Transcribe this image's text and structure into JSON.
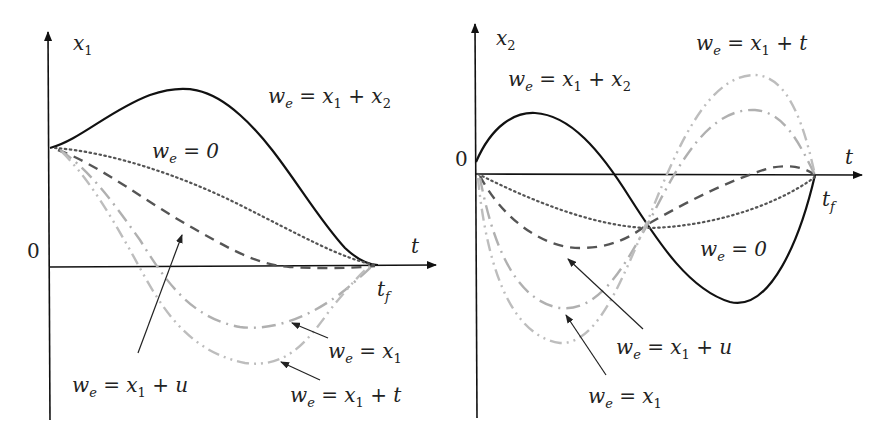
{
  "figure": {
    "left_panel": {
      "y_axis_label": "x",
      "y_axis_sub": "1",
      "x_axis_label": "t",
      "origin_label": "0",
      "end_label": "t",
      "end_sub": "f",
      "annotations": {
        "we_x1_x2": {
          "w": "w",
          "e": "e",
          "rest": " = x",
          "s1": "1",
          "plus": " + x",
          "s2": "2"
        },
        "we_0": {
          "w": "w",
          "e": "e",
          "rest": " = 0"
        },
        "we_x1_u": {
          "w": "w",
          "e": "e",
          "rest": " = x",
          "s1": "1",
          "tail": " + u"
        },
        "we_x1": {
          "w": "w",
          "e": "e",
          "rest": " = x",
          "s1": "1"
        },
        "we_x1_t": {
          "w": "w",
          "e": "e",
          "rest": " = x",
          "s1": "1",
          "tail": " + t"
        }
      }
    },
    "right_panel": {
      "y_axis_label": "x",
      "y_axis_sub": "2",
      "x_axis_label": "t",
      "origin_label": "0",
      "end_label": "t",
      "end_sub": "f",
      "annotations": {
        "we_x1_x2": {
          "w": "w",
          "e": "e",
          "rest": " = x",
          "s1": "1",
          "plus": " + x",
          "s2": "2"
        },
        "we_x1_t": {
          "w": "w",
          "e": "e",
          "rest": " = x",
          "s1": "1",
          "tail": " + t"
        },
        "we_0": {
          "w": "w",
          "e": "e",
          "rest": " = 0"
        },
        "we_x1_u": {
          "w": "w",
          "e": "e",
          "rest": " = x",
          "s1": "1",
          "tail": " + u"
        },
        "we_x1": {
          "w": "w",
          "e": "e",
          "rest": " = x",
          "s1": "1"
        }
      }
    },
    "legend_styles": [
      {
        "label": "w_e = x1 + x2",
        "style": "solid",
        "color": "#111111"
      },
      {
        "label": "w_e = 0",
        "style": "dotted",
        "color": "#555555"
      },
      {
        "label": "w_e = x1 + u",
        "style": "dashed",
        "color": "#555555"
      },
      {
        "label": "w_e = x1",
        "style": "dash-dot",
        "color": "#b0b0b0"
      },
      {
        "label": "w_e = x1 + t",
        "style": "dash-dot-dot",
        "color": "#bdbdbd"
      }
    ]
  }
}
